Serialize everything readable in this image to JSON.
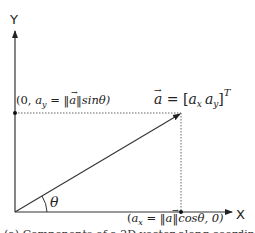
{
  "diagram": {
    "axes": {
      "x_label": "X",
      "y_label": "Y"
    },
    "angle_label": "θ",
    "vector_label": {
      "lhs": "a",
      "equals": " = [",
      "ax": "a",
      "ax_sub": "x",
      "ay": "a",
      "ay_sub": "y",
      "close": "]",
      "sup": "T"
    },
    "y_point_label": {
      "prefix": "(0, ",
      "var": "a",
      "sub": "y",
      "rest": " = ‖",
      "vec": "a",
      "rest2": "‖sinθ)"
    },
    "x_point_label": {
      "prefix": "(",
      "var": "a",
      "sub": "x",
      "rest": " = ‖",
      "vec": "a",
      "rest2": "‖cosθ, 0)"
    },
    "caption": "(a) Components of a 2D vector along coordinate axes",
    "colors": {
      "line": "#333333",
      "dotted": "#555555",
      "text": "#222222"
    }
  }
}
